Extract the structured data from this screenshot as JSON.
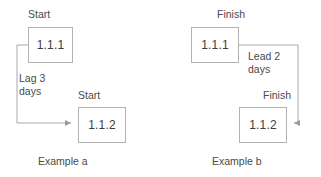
{
  "diagram": {
    "colors": {
      "box_border": "#b3b3b3",
      "connector": "#a9a9a9",
      "text": "#4a4a4a",
      "box_text": "#3c3c3c",
      "background": "#ffffff"
    },
    "examples": [
      {
        "id": "example-a",
        "caption": "Example a",
        "relationship": "start-to-start",
        "predecessor": {
          "box_label": "1.1.1",
          "endpoint_label": "Start"
        },
        "successor": {
          "box_label": "1.1.2",
          "endpoint_label": "Start"
        },
        "connector_label_line1": "Lag 3",
        "connector_label_line2": "days",
        "connector_label": "Lag 3 days"
      },
      {
        "id": "example-b",
        "caption": "Example b",
        "relationship": "finish-to-finish",
        "predecessor": {
          "box_label": "1.1.1",
          "endpoint_label": "Finish"
        },
        "successor": {
          "box_label": "1.1.2",
          "endpoint_label": "Finish"
        },
        "connector_label_line1": "Lead 2",
        "connector_label_line2": "days",
        "connector_label": "Lead 2 days"
      }
    ]
  }
}
